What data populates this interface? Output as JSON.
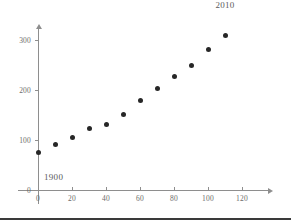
{
  "chart_data": {
    "type": "scatter",
    "title": "",
    "xlabel": "",
    "ylabel": "",
    "xlim": [
      -5,
      135
    ],
    "ylim": [
      -12,
      330
    ],
    "grid": false,
    "legend": "none",
    "x_ticks": [
      0,
      20,
      40,
      60,
      80,
      100,
      120
    ],
    "x_tick_labels": [
      "0",
      "20",
      "40",
      "60",
      "80",
      "100",
      "120"
    ],
    "y_ticks": [
      0,
      100,
      200,
      300
    ],
    "y_tick_labels": [
      "0",
      "100",
      "200",
      "300"
    ],
    "x": [
      0,
      10,
      20,
      30,
      40,
      50,
      60,
      70,
      80,
      90,
      100,
      110
    ],
    "values": [
      76,
      92,
      106,
      123,
      132,
      151,
      179,
      203,
      227,
      249,
      281,
      309
    ],
    "annotations": [
      {
        "text": "1900",
        "x": 0,
        "y": 76,
        "dx": 6,
        "dy": -20
      },
      {
        "text": "2010",
        "x": 110,
        "y": 309,
        "dx": 0,
        "dy": 26
      }
    ],
    "marker_color": "#272727",
    "axis_color": "#8e8e8e"
  }
}
